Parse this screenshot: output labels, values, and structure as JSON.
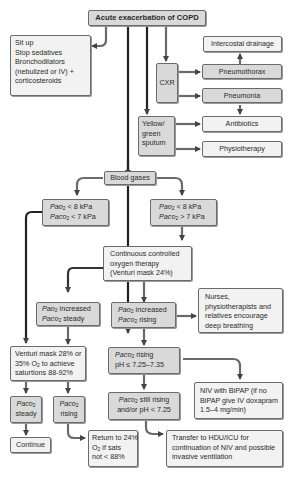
{
  "diagram": {
    "title": "Acute exacerbation of COPD",
    "colors": {
      "box_gray": "#d9d9d9",
      "box_light": "#f2f2f2",
      "border": "#6b6b6b",
      "arrow": "#555555"
    },
    "nodes": {
      "initial_measures": [
        "Sit up",
        "Stop sedatives",
        "Bronchodilators",
        "(nebulized or IV) +",
        "corticosteroids"
      ],
      "cxr": "CXR",
      "intercostal_drainage": "Intercostal drainage",
      "pneumothorax": "Pneumothorax",
      "pneumonia": "Pneumonia",
      "sputum": [
        "Yellow/",
        "green",
        "sputum"
      ],
      "antibiotics": "Antibiotics",
      "physiotherapy": "Physiotherapy",
      "blood_gases": "Blood gases",
      "left_gas": {
        "l1_prefix": "Pao",
        "l1_sub": "2",
        "l1_suffix": " < 8 kPa",
        "l2_prefix": "Paco",
        "l2_sub": "2",
        "l2_suffix": " < 7 kPa"
      },
      "right_gas": {
        "l1_prefix": "Pao",
        "l1_sub": "2",
        "l1_suffix": " < 8 kPa",
        "l2_prefix": "Paco",
        "l2_sub": "2",
        "l2_suffix": " > 7 kPa"
      },
      "oxygen_therapy": [
        "Continuous controlled",
        "oxygen therapy",
        "(Venturi mask 24%)"
      ],
      "pao2_inc_steady": {
        "l1_prefix": "Pao",
        "l1_sub": "2",
        "l1_suffix": " increased",
        "l2_prefix": "Paco",
        "l2_sub": "2",
        "l2_suffix": " steady"
      },
      "pao2_inc_rising": {
        "l1_prefix": "Pao",
        "l1_sub": "2",
        "l1_suffix": " increased",
        "l2_prefix": "Paco",
        "l2_sub": "2",
        "l2_suffix": " rising"
      },
      "encourage_breathing": [
        "Nurses,",
        "physiotherapists and",
        "relatives encourage",
        "deep breathing"
      ],
      "venturi": {
        "l1": "Venturi mask 28% or",
        "l2_prefix": "35% O",
        "l2_sub": "2",
        "l2_suffix": " to achieve",
        "l3": "saturtions 88-92%"
      },
      "paco2_rising_ph": {
        "l1_prefix": "Paco",
        "l1_sub": "2",
        "l1_suffix": " rising",
        "l2": "pH ≤ 7.25–7.35"
      },
      "niv": [
        "NIV with BiPAP (if no",
        "BiPAP give IV doxapram",
        "1.5–4 mg/min)"
      ],
      "paco2_steady": {
        "l1_prefix": "Paco",
        "l1_sub": "2",
        "l2": "steady"
      },
      "paco2_rising": {
        "l1_prefix": "Paco",
        "l1_sub": "2",
        "l2": "rising"
      },
      "paco2_still_rising": {
        "l1_prefix": "Paco",
        "l1_sub": "2",
        "l1_suffix": " still rising",
        "l2": "and/or pH < 7.25"
      },
      "continue": "Continue",
      "return_24": {
        "l1": "Return to 24%",
        "l2_prefix": "O",
        "l2_sub": "2",
        "l2_suffix": " if sats",
        "l3": "not < 88%"
      },
      "transfer": [
        "Transfer to HDU/ICU for",
        "continuation of NIV and possible",
        "invasive ventilation"
      ]
    }
  }
}
